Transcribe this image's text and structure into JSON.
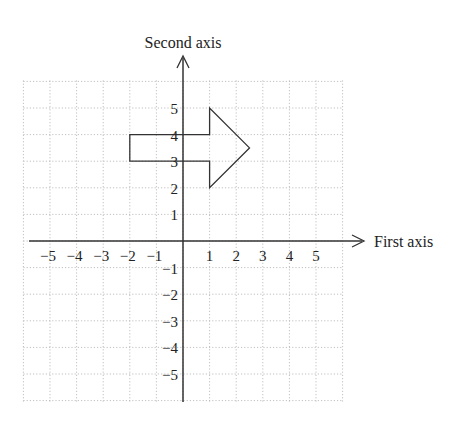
{
  "diagram": {
    "type": "coordinate-plane",
    "x_axis_label": "First axis",
    "y_axis_label": "Second axis",
    "x_range": [
      -6,
      6
    ],
    "y_range": [
      -6,
      6
    ],
    "x_ticks": [
      "-5",
      "-4",
      "-3",
      "-2",
      "-1",
      "1",
      "2",
      "3",
      "4",
      "5"
    ],
    "y_ticks": [
      "5",
      "4",
      "3",
      "2",
      "1",
      "-1",
      "-2",
      "-3",
      "-4",
      "-5"
    ],
    "grid": "dotted",
    "shape": {
      "name": "arrow",
      "vertices": [
        [
          -2,
          3
        ],
        [
          1,
          3
        ],
        [
          1,
          2
        ],
        [
          2.5,
          3.5
        ],
        [
          1,
          5
        ],
        [
          1,
          4
        ],
        [
          -2,
          4
        ]
      ]
    },
    "colors": {
      "grid": "#b0b0b0",
      "axes": "#333333",
      "shape": "#333333",
      "text": "#222222"
    }
  }
}
